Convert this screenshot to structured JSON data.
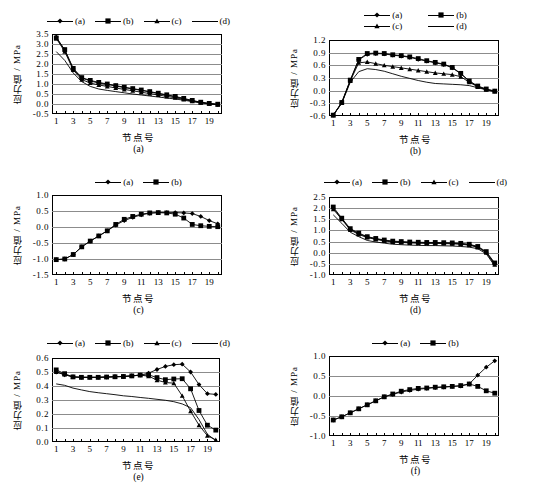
{
  "figure": {
    "axis_titles": {
      "x": "节点号",
      "y": "应力值 / MPa"
    },
    "captions": [
      "(a)",
      "(b)",
      "(c)",
      "(d)",
      "(e)",
      "(f)"
    ],
    "x_tick_labels": [
      "1",
      "3",
      "5",
      "7",
      "9",
      "11",
      "13",
      "15",
      "17",
      "19"
    ],
    "series_colors": {
      "line": "#000000",
      "grid": "#8c8c8c",
      "frame": "#000000",
      "background": "#ffffff"
    },
    "marker_names": {
      "a": "diamond-marker",
      "b": "square-marker",
      "c": "triangle-marker",
      "d": "cross-marker"
    }
  },
  "chart_data": [
    {
      "type": "line",
      "id": "a",
      "title": "(a)",
      "xlabel": "节点号",
      "ylabel": "应力值 / MPa",
      "x": [
        1,
        2,
        3,
        4,
        5,
        6,
        7,
        8,
        9,
        10,
        11,
        12,
        13,
        14,
        15,
        16,
        17,
        18,
        19,
        20
      ],
      "xlim": [
        1,
        20
      ],
      "ylim": [
        -0.5,
        3.5
      ],
      "yticks": [
        "3.5",
        "3.0",
        "2.5",
        "2.0",
        "1.5",
        "1.0",
        "0.5",
        "0.0",
        "-0.5"
      ],
      "grid": true,
      "legend": [
        "(a)",
        "(b)",
        "(c)",
        "(d)"
      ],
      "legend_position": "top-center",
      "legend_rows": 1,
      "series": [
        {
          "name": "(a)",
          "marker": "diamond",
          "values": [
            3.35,
            2.7,
            1.75,
            1.3,
            1.15,
            1.05,
            0.98,
            0.9,
            0.82,
            0.75,
            0.68,
            0.6,
            0.52,
            0.44,
            0.36,
            0.26,
            0.16,
            0.08,
            0.02,
            -0.02
          ]
        },
        {
          "name": "(b)",
          "marker": "square",
          "values": [
            3.3,
            2.72,
            1.78,
            1.32,
            1.18,
            1.08,
            1.0,
            0.92,
            0.84,
            0.77,
            0.7,
            0.62,
            0.54,
            0.46,
            0.38,
            0.28,
            0.18,
            0.09,
            0.03,
            -0.01
          ]
        },
        {
          "name": "(c)",
          "marker": "triangle",
          "values": [
            3.28,
            2.62,
            1.7,
            1.22,
            1.05,
            0.95,
            0.88,
            0.8,
            0.73,
            0.66,
            0.59,
            0.52,
            0.45,
            0.38,
            0.31,
            0.23,
            0.14,
            0.07,
            0.01,
            -0.03
          ]
        },
        {
          "name": "(d)",
          "marker": "cross",
          "values": [
            2.62,
            2.18,
            1.55,
            1.12,
            0.88,
            0.75,
            0.68,
            0.62,
            0.56,
            0.5,
            0.45,
            0.4,
            0.35,
            0.3,
            0.25,
            0.19,
            0.12,
            0.06,
            0.0,
            -0.04
          ]
        }
      ]
    },
    {
      "type": "line",
      "id": "b",
      "title": "(b)",
      "xlabel": "节点号",
      "ylabel": "应力值 / MPa",
      "x": [
        1,
        2,
        3,
        4,
        5,
        6,
        7,
        8,
        9,
        10,
        11,
        12,
        13,
        14,
        15,
        16,
        17,
        18,
        19,
        20
      ],
      "xlim": [
        1,
        20
      ],
      "ylim": [
        -0.6,
        1.2
      ],
      "yticks": [
        "1.2",
        "0.9",
        "0.6",
        "0.3",
        "0.0",
        "-0.3",
        "-0.6"
      ],
      "grid": true,
      "legend": [
        "(a)",
        "(b)",
        "(c)",
        "(d)"
      ],
      "legend_position": "top-center",
      "legend_rows": 2,
      "series": [
        {
          "name": "(a)",
          "marker": "diamond",
          "values": [
            -0.58,
            -0.28,
            0.24,
            0.73,
            0.86,
            0.88,
            0.87,
            0.84,
            0.82,
            0.79,
            0.74,
            0.7,
            0.66,
            0.62,
            0.54,
            0.4,
            0.22,
            0.1,
            0.03,
            -0.01
          ]
        },
        {
          "name": "(b)",
          "marker": "square",
          "values": [
            -0.58,
            -0.28,
            0.25,
            0.74,
            0.88,
            0.89,
            0.88,
            0.85,
            0.83,
            0.8,
            0.76,
            0.71,
            0.67,
            0.63,
            0.55,
            0.41,
            0.23,
            0.11,
            0.04,
            -0.01
          ]
        },
        {
          "name": "(c)",
          "marker": "triangle",
          "values": [
            -0.58,
            -0.29,
            0.23,
            0.66,
            0.68,
            0.64,
            0.6,
            0.57,
            0.54,
            0.51,
            0.48,
            0.45,
            0.42,
            0.4,
            0.38,
            0.33,
            0.2,
            0.09,
            0.02,
            -0.02
          ]
        },
        {
          "name": "(d)",
          "marker": "cross",
          "values": [
            -0.58,
            -0.3,
            0.2,
            0.45,
            0.52,
            0.5,
            0.46,
            0.4,
            0.34,
            0.29,
            0.24,
            0.2,
            0.17,
            0.16,
            0.15,
            0.14,
            0.12,
            0.07,
            0.02,
            -0.02
          ]
        }
      ]
    },
    {
      "type": "line",
      "id": "c",
      "title": "(c)",
      "xlabel": "节点号",
      "ylabel": "应力值 / MPa",
      "x": [
        1,
        2,
        3,
        4,
        5,
        6,
        7,
        8,
        9,
        10,
        11,
        12,
        13,
        14,
        15,
        16,
        17,
        18,
        19,
        20
      ],
      "xlim": [
        1,
        20
      ],
      "ylim": [
        -1.5,
        1.0
      ],
      "yticks": [
        "1.0",
        "0.5",
        "0.0",
        "-0.5",
        "-1.0",
        "-1.5"
      ],
      "grid": true,
      "legend": [
        "(a)",
        "(b)"
      ],
      "legend_position": "top-center",
      "legend_rows": 1,
      "series": [
        {
          "name": "(a)",
          "marker": "diamond",
          "values": [
            -1.02,
            -1.0,
            -0.86,
            -0.62,
            -0.44,
            -0.28,
            -0.12,
            0.06,
            0.2,
            0.3,
            0.38,
            0.43,
            0.45,
            0.45,
            0.45,
            0.44,
            0.42,
            0.33,
            0.2,
            0.1
          ]
        },
        {
          "name": "(b)",
          "marker": "square",
          "values": [
            -1.02,
            -1.0,
            -0.86,
            -0.62,
            -0.44,
            -0.28,
            -0.12,
            0.08,
            0.24,
            0.33,
            0.4,
            0.44,
            0.45,
            0.44,
            0.4,
            0.28,
            0.08,
            0.04,
            0.02,
            0.01
          ]
        }
      ]
    },
    {
      "type": "line",
      "id": "d",
      "title": "(d)",
      "xlabel": "节点号",
      "ylabel": "应力值 / MPa",
      "x": [
        1,
        2,
        3,
        4,
        5,
        6,
        7,
        8,
        9,
        10,
        11,
        12,
        13,
        14,
        15,
        16,
        17,
        18,
        19,
        20
      ],
      "xlim": [
        1,
        20
      ],
      "ylim": [
        -1.0,
        2.5
      ],
      "yticks": [
        "2.5",
        "2.0",
        "1.5",
        "1.0",
        "0.5",
        "0.0",
        "-0.5",
        "-1.0"
      ],
      "grid": true,
      "legend": [
        "(a)",
        "(b)",
        "(c)",
        "(d)"
      ],
      "legend_position": "top-center",
      "legend_rows": 1,
      "series": [
        {
          "name": "(a)",
          "marker": "diamond",
          "values": [
            2.0,
            1.52,
            1.05,
            0.85,
            0.7,
            0.62,
            0.55,
            0.5,
            0.48,
            0.46,
            0.45,
            0.44,
            0.44,
            0.43,
            0.42,
            0.4,
            0.36,
            0.26,
            0.02,
            -0.5
          ]
        },
        {
          "name": "(b)",
          "marker": "square",
          "values": [
            2.05,
            1.55,
            1.08,
            0.88,
            0.72,
            0.64,
            0.57,
            0.52,
            0.5,
            0.48,
            0.47,
            0.46,
            0.46,
            0.45,
            0.44,
            0.42,
            0.38,
            0.28,
            0.05,
            -0.46
          ]
        },
        {
          "name": "(c)",
          "marker": "triangle",
          "values": [
            1.95,
            1.5,
            1.02,
            0.82,
            0.68,
            0.6,
            0.53,
            0.48,
            0.46,
            0.44,
            0.43,
            0.42,
            0.42,
            0.41,
            0.4,
            0.38,
            0.34,
            0.24,
            0.0,
            -0.54
          ]
        },
        {
          "name": "(d)",
          "marker": "cross",
          "values": [
            1.7,
            1.32,
            0.92,
            0.72,
            0.55,
            0.48,
            0.43,
            0.38,
            0.36,
            0.34,
            0.33,
            0.32,
            0.32,
            0.31,
            0.3,
            0.28,
            0.25,
            0.18,
            -0.05,
            -0.6
          ]
        }
      ]
    },
    {
      "type": "line",
      "id": "e",
      "title": "(e)",
      "xlabel": "节点号",
      "ylabel": "应力值 / MPa",
      "x": [
        1,
        2,
        3,
        4,
        5,
        6,
        7,
        8,
        9,
        10,
        11,
        12,
        13,
        14,
        15,
        16,
        17,
        18,
        19,
        20
      ],
      "xlim": [
        1,
        20
      ],
      "ylim": [
        0.0,
        0.6
      ],
      "yticks": [
        "0.6",
        "0.5",
        "0.4",
        "0.3",
        "0.2",
        "0.1",
        "0.0"
      ],
      "grid": true,
      "legend": [
        "(a)",
        "(b)",
        "(c)",
        "(d)"
      ],
      "legend_position": "top-center",
      "legend_rows": 1,
      "series": [
        {
          "name": "(a)",
          "marker": "diamond",
          "values": [
            0.5,
            0.48,
            0.465,
            0.462,
            0.462,
            0.462,
            0.464,
            0.466,
            0.468,
            0.472,
            0.478,
            0.492,
            0.518,
            0.54,
            0.552,
            0.556,
            0.5,
            0.41,
            0.345,
            0.34
          ]
        },
        {
          "name": "(b)",
          "marker": "square",
          "values": [
            0.515,
            0.488,
            0.465,
            0.462,
            0.462,
            0.462,
            0.464,
            0.466,
            0.468,
            0.472,
            0.478,
            0.48,
            0.46,
            0.445,
            0.45,
            0.452,
            0.38,
            0.225,
            0.12,
            0.085
          ]
        },
        {
          "name": "(c)",
          "marker": "triangle",
          "values": [
            0.5,
            0.482,
            0.465,
            0.462,
            0.462,
            0.462,
            0.464,
            0.466,
            0.468,
            0.472,
            0.478,
            0.47,
            0.442,
            0.425,
            0.42,
            0.33,
            0.22,
            0.12,
            0.045,
            0.015
          ]
        },
        {
          "name": "(d)",
          "marker": "cross",
          "values": [
            0.415,
            0.405,
            0.385,
            0.372,
            0.36,
            0.352,
            0.345,
            0.338,
            0.33,
            0.325,
            0.318,
            0.312,
            0.305,
            0.298,
            0.288,
            0.272,
            0.245,
            0.16,
            0.055,
            0.01
          ]
        }
      ]
    },
    {
      "type": "line",
      "id": "f",
      "title": "(f)",
      "xlabel": "节点号",
      "ylabel": "应力值 / MPa",
      "x": [
        1,
        2,
        3,
        4,
        5,
        6,
        7,
        8,
        9,
        10,
        11,
        12,
        13,
        14,
        15,
        16,
        17,
        18,
        19,
        20
      ],
      "xlim": [
        1,
        20
      ],
      "ylim": [
        -1.0,
        1.0
      ],
      "yticks": [
        "1.0",
        "0.5",
        "0.0",
        "-0.5",
        "-1.0"
      ],
      "grid": true,
      "legend": [
        "(a)",
        "(b)"
      ],
      "legend_position": "top-center",
      "legend_rows": 1,
      "series": [
        {
          "name": "(a)",
          "marker": "diamond",
          "values": [
            -0.6,
            -0.52,
            -0.42,
            -0.32,
            -0.22,
            -0.12,
            -0.02,
            0.04,
            0.1,
            0.14,
            0.17,
            0.19,
            0.21,
            0.22,
            0.24,
            0.25,
            0.3,
            0.52,
            0.72,
            0.88
          ]
        },
        {
          "name": "(b)",
          "marker": "square",
          "values": [
            -0.6,
            -0.52,
            -0.42,
            -0.32,
            -0.22,
            -0.12,
            -0.02,
            0.05,
            0.12,
            0.16,
            0.19,
            0.2,
            0.22,
            0.23,
            0.24,
            0.26,
            0.3,
            0.24,
            0.13,
            0.07
          ]
        }
      ]
    }
  ]
}
